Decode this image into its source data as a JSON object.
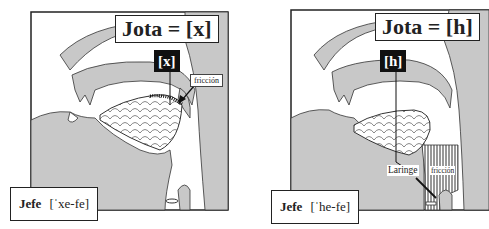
{
  "panels": [
    {
      "title": "Jota = [x]",
      "sound": "[x]",
      "friction_label": "fricción",
      "word": "Jefe",
      "transcription": "[ˈxe-fe]",
      "place": "velar"
    },
    {
      "title": "Jota = [h]",
      "sound": "[h]",
      "friction_label": "fricción",
      "larynx_label": "Laringe",
      "word": "Jefe",
      "transcription": "[ˈhe-fe]",
      "place": "glottal"
    }
  ],
  "colors": {
    "tissue": "#c8c8c8",
    "outline": "#333333",
    "frame": "#222222",
    "label_bg": "#111111"
  }
}
